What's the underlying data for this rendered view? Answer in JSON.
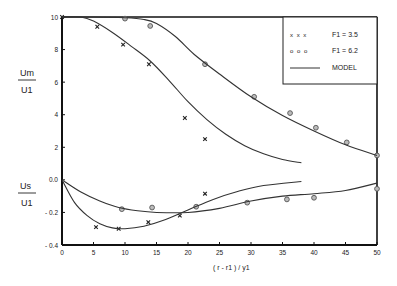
{
  "chart_data": {
    "type": "line",
    "title": "",
    "xlabel": "( r - r1 ) / y1",
    "ylabel_top": {
      "num": "Um",
      "den": "U1"
    },
    "ylabel_bottom": {
      "num": "Us",
      "den": "U1"
    },
    "xlim": [
      0,
      50
    ],
    "ylim": [
      -0.4,
      1.0
    ],
    "grid": false,
    "x_ticks": [
      0,
      5,
      10,
      15,
      20,
      25,
      30,
      35,
      40,
      45,
      50
    ],
    "x_tick_labels": [
      "0",
      "5",
      "10",
      "15",
      "20",
      "25",
      "30",
      "35",
      "40",
      "45",
      "50"
    ],
    "y_ticks": [
      1.0,
      0.8,
      0.6,
      0.4,
      0.2,
      0.0,
      -0.2,
      -0.4
    ],
    "y_tick_labels": [
      "10",
      "8",
      "6",
      "4",
      "2",
      "0.0",
      "- 0.2",
      "- 0.4"
    ],
    "legend": {
      "placement": "top-right",
      "entries": [
        {
          "marker": "x x x",
          "label": "F1 = 3.5"
        },
        {
          "marker": "o o o",
          "label": "F1 = 6.2"
        },
        {
          "marker": "line",
          "label": "MODEL"
        }
      ]
    },
    "series": [
      {
        "name": "Um/U1 F1=3.5 data",
        "marker": "x",
        "x": [
          0,
          5.6,
          9.7,
          13.8,
          19.5,
          22.7
        ],
        "y": [
          1.0,
          0.94,
          0.83,
          0.71,
          0.38,
          0.25
        ]
      },
      {
        "name": "Um/U1 F1=6.2 data",
        "marker": "o",
        "x": [
          10,
          14,
          22.7,
          30.5,
          36.2,
          40.3,
          45.2,
          50
        ],
        "y": [
          0.99,
          0.945,
          0.71,
          0.51,
          0.41,
          0.32,
          0.23,
          0.15
        ]
      },
      {
        "name": "Um/U1 F1=3.5 model",
        "marker": "line",
        "x": [
          0,
          3,
          5,
          8,
          11,
          14,
          17,
          20,
          23,
          26,
          29,
          32,
          35,
          38
        ],
        "y": [
          1.0,
          1.0,
          0.975,
          0.905,
          0.82,
          0.73,
          0.61,
          0.48,
          0.37,
          0.28,
          0.21,
          0.16,
          0.125,
          0.105
        ]
      },
      {
        "name": "Um/U1 F1=6.2 model",
        "marker": "line",
        "x": [
          0,
          5,
          10,
          13,
          15,
          18,
          21,
          25,
          30,
          35,
          40,
          45,
          50
        ],
        "y": [
          1.0,
          1.0,
          0.995,
          0.985,
          0.96,
          0.88,
          0.77,
          0.65,
          0.51,
          0.395,
          0.3,
          0.215,
          0.15
        ]
      },
      {
        "name": "Us/U1 F1=3.5 data",
        "marker": "x",
        "x": [
          5.4,
          9,
          13.7,
          18.7,
          22.7
        ],
        "y": [
          -0.29,
          -0.3,
          -0.26,
          -0.22,
          -0.085
        ]
      },
      {
        "name": "Us/U1 F1=6.2 data",
        "marker": "o",
        "x": [
          9.5,
          14.3,
          21.3,
          29.4,
          35.7,
          40,
          50
        ],
        "y": [
          -0.18,
          -0.17,
          -0.165,
          -0.14,
          -0.12,
          -0.11,
          -0.055
        ]
      },
      {
        "name": "Us/U1 F1=3.5 model",
        "marker": "line",
        "x": [
          0,
          2,
          4,
          6,
          8,
          10,
          13,
          16,
          20,
          24,
          28,
          32,
          38
        ],
        "y": [
          0.0,
          -0.14,
          -0.22,
          -0.27,
          -0.295,
          -0.3,
          -0.285,
          -0.25,
          -0.185,
          -0.12,
          -0.07,
          -0.035,
          -0.01
        ]
      },
      {
        "name": "Us/U1 F1=6.2 model",
        "marker": "line",
        "x": [
          0,
          3,
          6,
          9,
          12,
          15,
          20,
          25,
          30,
          35,
          40,
          45,
          50
        ],
        "y": [
          0.0,
          -0.075,
          -0.13,
          -0.17,
          -0.19,
          -0.2,
          -0.2,
          -0.175,
          -0.13,
          -0.1,
          -0.085,
          -0.065,
          -0.02
        ]
      }
    ]
  }
}
